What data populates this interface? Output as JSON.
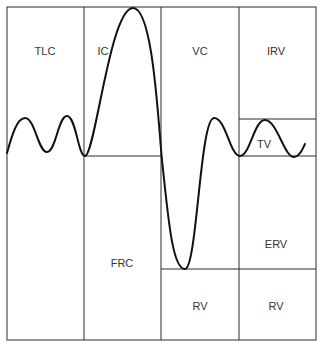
{
  "diagram": {
    "colors": {
      "line": "#2a2a2a",
      "curve": "#111111",
      "text": "#333333",
      "background": "#ffffff"
    },
    "labels": {
      "tlc": "TLC",
      "ic": "IC",
      "vc": "VC",
      "irv": "IRV",
      "tv": "TV",
      "frc": "FRC",
      "erv": "ERV",
      "rv_vc_column": "RV",
      "rv_right_column": "RV"
    },
    "label_positions": {
      "tlc": [
        45,
        51
      ],
      "ic": [
        103,
        51
      ],
      "vc": [
        200,
        51
      ],
      "irv": [
        276,
        51
      ],
      "tv": [
        264,
        144
      ],
      "frc": [
        122,
        263
      ],
      "erv": [
        276,
        244
      ],
      "rv_vc_column": [
        200,
        306
      ],
      "rv_right_column": [
        276,
        306
      ]
    },
    "grid": {
      "outer": {
        "left": 7,
        "top": 7,
        "right": 316,
        "bottom": 340
      },
      "verticals_x": [
        84,
        161,
        239
      ],
      "horizontals": [
        {
          "name": "ic-frc-divider",
          "y": 156,
          "x1": 84,
          "x2": 161
        },
        {
          "name": "irv-tv-divider",
          "y": 119,
          "x1": 239,
          "x2": 316
        },
        {
          "name": "tv-erv-divider",
          "y": 156,
          "x1": 239,
          "x2": 316
        },
        {
          "name": "rv-divider",
          "y": 269,
          "x1": 161,
          "x2": 316
        }
      ]
    },
    "curve_path": "M7,153 C12,135 17,118 25,118 C35,118 38,152 47,152 C56,152 58,116 67,116 C76,116 78,156 85,156 C95,156 110,8 133,8 C153,8 158,120 162,160 C168,215 172,269 185,269 C197,269 200,118 214,118 C226,118 230,156 240,156 C250,156 254,120 265,120 C277,120 284,157 294,157 C300,157 303,148 305,144"
  }
}
